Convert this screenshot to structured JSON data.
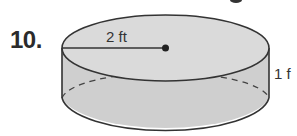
{
  "problem": {
    "number": "10."
  },
  "figure": {
    "shape": "cylinder",
    "radius_label": "2 ft",
    "height_label": "1 f",
    "fill_color": "#d0d0d0",
    "stroke_color": "#333333"
  }
}
